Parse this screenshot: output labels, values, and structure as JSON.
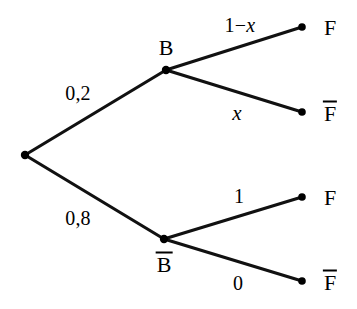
{
  "diagram": {
    "type": "probability-tree",
    "title": "",
    "background_color": "#ffffff",
    "stroke_color": "#000000",
    "nodes": {
      "root": {
        "label": "",
        "x": 25,
        "y": 155
      },
      "b": {
        "label": "B",
        "x": 166,
        "y": 70,
        "label_x": 166,
        "label_y": 48
      },
      "bbar": {
        "label": "B",
        "overline": true,
        "x": 164,
        "y": 239,
        "label_x": 164,
        "label_y": 264
      },
      "leaf1": {
        "label": "F",
        "overline": false,
        "x": 302,
        "y": 27,
        "label_x": 330,
        "label_y": 28
      },
      "leaf2": {
        "label": "F",
        "overline": true,
        "x": 302,
        "y": 112,
        "label_x": 330,
        "label_y": 113
      },
      "leaf3": {
        "label": "F",
        "overline": false,
        "x": 302,
        "y": 197,
        "label_x": 330,
        "label_y": 198
      },
      "leaf4": {
        "label": "F",
        "overline": true,
        "x": 302,
        "y": 281,
        "label_x": 330,
        "label_y": 282
      }
    },
    "branches": [
      {
        "from": "root",
        "to": "b",
        "probability": "0,2",
        "label_x": 78,
        "label_y": 93
      },
      {
        "from": "root",
        "to": "bbar",
        "probability": "0,8",
        "label_x": 78,
        "label_y": 218
      },
      {
        "from": "b",
        "to": "leaf1",
        "probability": "1-x",
        "label_x": 240,
        "label_y": 25
      },
      {
        "from": "b",
        "to": "leaf2",
        "probability": "x",
        "label_x": 237,
        "label_y": 113
      },
      {
        "from": "bbar",
        "to": "leaf3",
        "probability": "1",
        "label_x": 239,
        "label_y": 196
      },
      {
        "from": "bbar",
        "to": "leaf4",
        "probability": "0",
        "label_x": 238,
        "label_y": 283
      }
    ],
    "labels": {
      "prob_root_b": "0,2",
      "prob_root_bbar": "0,8",
      "prob_b_f": "1−",
      "prob_b_f_var": "x",
      "prob_b_fbar": "x",
      "prob_bbar_f": "1",
      "prob_bbar_fbar": "0",
      "node_b": "B",
      "node_bbar": "B",
      "leaf_f_1": "F",
      "leaf_fbar_1": "F",
      "leaf_f_2": "F",
      "leaf_fbar_2": "F"
    }
  }
}
